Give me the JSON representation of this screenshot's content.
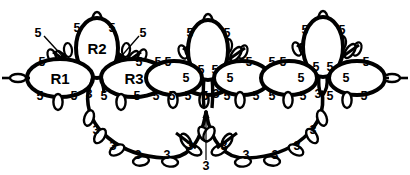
{
  "diagram": {
    "type": "tatting-lace-motif",
    "colors": {
      "stroke": "#000000",
      "background": "#ffffff",
      "text": "#000000"
    },
    "ring_labels": [
      {
        "id": "R1",
        "text": "R1",
        "x": 60,
        "y": 78
      },
      {
        "id": "R2",
        "text": "R2",
        "x": 97,
        "y": 48
      },
      {
        "id": "R3",
        "text": "R3",
        "x": 134,
        "y": 78
      }
    ],
    "picot_counts": {
      "upper_value": "5",
      "lower_value": "3"
    },
    "numbers": [
      {
        "text": "5",
        "x": 38,
        "y": 33
      },
      {
        "text": "5",
        "x": 77,
        "y": 28
      },
      {
        "text": "5",
        "x": 112,
        "y": 28
      },
      {
        "text": "5",
        "x": 143,
        "y": 33
      },
      {
        "text": "5",
        "x": 42,
        "y": 62
      },
      {
        "text": "5",
        "x": 139,
        "y": 62
      },
      {
        "text": "5",
        "x": 40,
        "y": 96
      },
      {
        "text": "5",
        "x": 74,
        "y": 96
      },
      {
        "text": "3",
        "x": 89,
        "y": 94
      },
      {
        "text": "5",
        "x": 104,
        "y": 96
      },
      {
        "text": "5",
        "x": 137,
        "y": 96
      },
      {
        "text": "5",
        "x": 158,
        "y": 62
      },
      {
        "text": "5",
        "x": 156,
        "y": 96
      },
      {
        "text": "5",
        "x": 188,
        "y": 96
      },
      {
        "text": "5",
        "x": 190,
        "y": 33
      },
      {
        "text": "5",
        "x": 227,
        "y": 33
      },
      {
        "text": "5",
        "x": 201,
        "y": 70
      },
      {
        "text": "5",
        "x": 215,
        "y": 70
      },
      {
        "text": "5",
        "x": 168,
        "y": 62
      },
      {
        "text": "5",
        "x": 249,
        "y": 62
      },
      {
        "text": "5",
        "x": 186,
        "y": 78
      },
      {
        "text": "5",
        "x": 230,
        "y": 78
      },
      {
        "text": "5",
        "x": 172,
        "y": 96
      },
      {
        "text": "5",
        "x": 205,
        "y": 96
      },
      {
        "text": "3",
        "x": 216,
        "y": 94
      },
      {
        "text": "5",
        "x": 227,
        "y": 96
      },
      {
        "text": "5",
        "x": 256,
        "y": 96
      },
      {
        "text": "5",
        "x": 272,
        "y": 62
      },
      {
        "text": "5",
        "x": 272,
        "y": 96
      },
      {
        "text": "5",
        "x": 303,
        "y": 96
      },
      {
        "text": "5",
        "x": 305,
        "y": 30
      },
      {
        "text": "5",
        "x": 342,
        "y": 30
      },
      {
        "text": "5",
        "x": 316,
        "y": 67
      },
      {
        "text": "5",
        "x": 330,
        "y": 67
      },
      {
        "text": "5",
        "x": 283,
        "y": 62
      },
      {
        "text": "5",
        "x": 366,
        "y": 62
      },
      {
        "text": "5",
        "x": 301,
        "y": 78
      },
      {
        "text": "5",
        "x": 346,
        "y": 78
      },
      {
        "text": "3",
        "x": 318,
        "y": 94
      },
      {
        "text": "5",
        "x": 330,
        "y": 96
      },
      {
        "text": "5",
        "x": 364,
        "y": 96
      },
      {
        "text": "3",
        "x": 96,
        "y": 130
      },
      {
        "text": "3",
        "x": 113,
        "y": 146
      },
      {
        "text": "3",
        "x": 138,
        "y": 155
      },
      {
        "text": "3",
        "x": 167,
        "y": 155
      },
      {
        "text": "3",
        "x": 190,
        "y": 146
      },
      {
        "text": "3",
        "x": 224,
        "y": 146
      },
      {
        "text": "3",
        "x": 246,
        "y": 155
      },
      {
        "text": "3",
        "x": 275,
        "y": 155
      },
      {
        "text": "3",
        "x": 297,
        "y": 146
      },
      {
        "text": "3",
        "x": 313,
        "y": 130
      },
      {
        "text": "3",
        "x": 206,
        "y": 166
      }
    ],
    "annotations": [
      {
        "id": "leader-left",
        "label": "5",
        "from": {
          "x": 38,
          "y": 33
        },
        "to": {
          "x": 70,
          "y": 62
        }
      },
      {
        "id": "leader-right",
        "label": "5",
        "from": {
          "x": 143,
          "y": 33
        },
        "to": {
          "x": 120,
          "y": 62
        }
      },
      {
        "id": "leader-center-bottom",
        "label": "3",
        "from": {
          "x": 206,
          "y": 160
        },
        "to": {
          "x": 206,
          "y": 112
        }
      }
    ]
  }
}
